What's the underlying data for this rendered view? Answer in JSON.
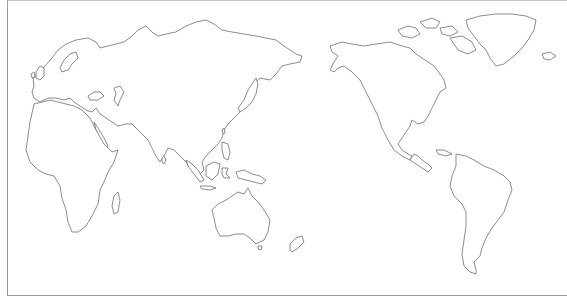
{
  "map": {
    "type": "outline-world-map",
    "projection_center": "pacific",
    "stroke_color": "#6e6e6e",
    "fill_color": "#ffffff",
    "frame_color": "#9a9a9a",
    "labels": [],
    "regions": [
      {
        "id": "eurasia",
        "name": "Eurasia"
      },
      {
        "id": "africa",
        "name": "Africa"
      },
      {
        "id": "australia",
        "name": "Australia"
      },
      {
        "id": "north-america",
        "name": "North America"
      },
      {
        "id": "south-america",
        "name": "South America"
      },
      {
        "id": "greenland",
        "name": "Greenland"
      },
      {
        "id": "new-zealand",
        "name": "New Zealand"
      },
      {
        "id": "japan",
        "name": "Japan"
      },
      {
        "id": "madagascar",
        "name": "Madagascar"
      },
      {
        "id": "indonesia",
        "name": "Indonesia"
      },
      {
        "id": "british-isles",
        "name": "British Isles"
      },
      {
        "id": "iceland",
        "name": "Iceland"
      }
    ]
  }
}
